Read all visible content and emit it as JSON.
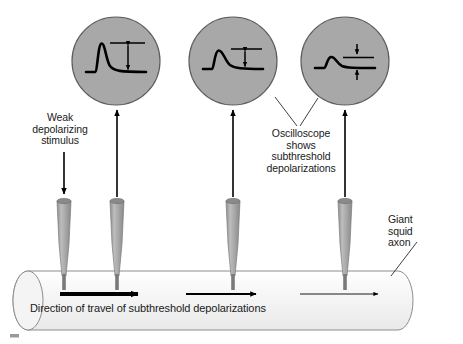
{
  "figure": {
    "width": 463,
    "height": 344,
    "background_color": "#ffffff"
  },
  "colors": {
    "oscilloscope_fill": "#a8a8a8",
    "oscilloscope_stroke": "#4d4d4d",
    "electrode_body": "#a8a8a8",
    "electrode_top": "#8a8a8a",
    "electrode_tip": "#6e6e6e",
    "axon_fill": "#f2f2f2",
    "axon_stroke": "#8c8c8c",
    "trace_color": "#000000",
    "text_color": "#1a1a1a"
  },
  "labels": {
    "weak_stimulus": "Weak\ndepolarizing\nstimulus",
    "oscilloscope": "Oscilloscope\nshows\nsubthreshold\ndepolarizations",
    "giant_axon": "Giant\nsquid\naxon",
    "direction": "Direction of travel of subthreshold depolarizations"
  },
  "oscilloscopes": [
    {
      "id": "oscilloscope-1",
      "name": "oscilloscope-trace-large",
      "center_x": 116,
      "center_y": 61,
      "radius": 44,
      "amplitude_label": "largest subthreshold depolarization",
      "peak_height": 30,
      "arrow_style": "double-headed-outward"
    },
    {
      "id": "oscilloscope-2",
      "name": "oscilloscope-trace-medium",
      "center_x": 233,
      "center_y": 61,
      "radius": 44,
      "amplitude_label": "reduced subthreshold depolarization",
      "peak_height": 18,
      "arrow_style": "double-headed-outward"
    },
    {
      "id": "oscilloscope-3",
      "name": "oscilloscope-trace-small",
      "center_x": 345,
      "center_y": 61,
      "radius": 44,
      "amplitude_label": "smallest subthreshold depolarization",
      "peak_height": 8,
      "arrow_style": "double-headed-inward"
    }
  ],
  "electrodes": [
    {
      "id": "electrode-1",
      "name": "stimulating-electrode",
      "x": 64,
      "has_recording_arrow": false,
      "has_stimulus_arrow": true
    },
    {
      "id": "electrode-2",
      "name": "recording-electrode-1",
      "x": 117,
      "has_recording_arrow": true,
      "has_stimulus_arrow": false
    },
    {
      "id": "electrode-3",
      "name": "recording-electrode-2",
      "x": 233,
      "has_recording_arrow": true,
      "has_stimulus_arrow": false
    },
    {
      "id": "electrode-4",
      "name": "recording-electrode-3",
      "x": 345,
      "has_recording_arrow": true,
      "has_stimulus_arrow": false
    }
  ],
  "travel_arrows": [
    {
      "id": "travel-arrow-1",
      "x1": 60,
      "x2": 140,
      "thickness": 4.0,
      "head": 8
    },
    {
      "id": "travel-arrow-2",
      "x1": 186,
      "x2": 258,
      "thickness": 2.2,
      "head": 6
    },
    {
      "id": "travel-arrow-3",
      "x1": 300,
      "x2": 380,
      "thickness": 1.0,
      "head": 4
    }
  ],
  "axon": {
    "name": "giant-squid-axon",
    "left": 13,
    "right": 412,
    "top": 271,
    "bottom": 330,
    "cap_width": 30
  }
}
